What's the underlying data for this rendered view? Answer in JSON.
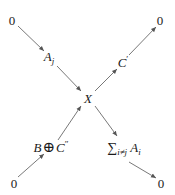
{
  "diagram": {
    "type": "exact-sequence-cross",
    "nodes": {
      "top_left": "0",
      "top_right": "0",
      "bottom_left": "0",
      "bottom_right": "0",
      "center": "X",
      "upper_left": {
        "base": "A",
        "sub": "j"
      },
      "upper_right": {
        "base": "C",
        "prime": "′"
      },
      "lower_left": {
        "left": "B",
        "op": "⊕",
        "right": "C",
        "prime": "″"
      },
      "lower_right": {
        "sigma": "∑",
        "sub": "i≠j",
        "base": "A",
        "base_sub": "i"
      }
    },
    "arrows": [
      {
        "from": "top_left",
        "to": "upper_left"
      },
      {
        "from": "upper_left",
        "to": "center"
      },
      {
        "from": "center",
        "to": "upper_right"
      },
      {
        "from": "upper_right",
        "to": "top_right"
      },
      {
        "from": "bottom_left",
        "to": "lower_left"
      },
      {
        "from": "lower_left",
        "to": "center"
      },
      {
        "from": "center",
        "to": "lower_right"
      },
      {
        "from": "lower_right",
        "to": "bottom_right"
      }
    ],
    "colors": {
      "line": "#555555",
      "text": "#1a1a1a",
      "background": "#ffffff"
    }
  }
}
